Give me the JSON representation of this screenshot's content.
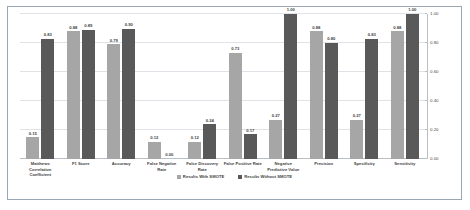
{
  "chart_data": {
    "type": "bar",
    "title": "",
    "xlabel": "",
    "ylabel": "",
    "ylim": [
      0.0,
      1.0
    ],
    "yticks": [
      "0.00",
      "0.20",
      "0.40",
      "0.60",
      "0.80",
      "1.00"
    ],
    "ytick_values": [
      0.0,
      0.2,
      0.4,
      0.6,
      0.8,
      1.0
    ],
    "y_axis_position": "right",
    "grid": true,
    "legend_position": "bottom-center",
    "categories": [
      "Matthews Correlation Coefficient",
      "F1 Score",
      "Accuracy",
      "False Negative Rate",
      "False Discovery Rate",
      "False Positive Rate",
      "Negative Predictive Value",
      "Precision",
      "Specificity",
      "Sensitivity"
    ],
    "series": [
      {
        "name": "Results With SMOTE",
        "color": "#a6a6a6",
        "values": [
          0.15,
          0.88,
          0.79,
          0.12,
          0.12,
          0.73,
          0.27,
          0.88,
          0.27,
          0.88
        ],
        "labels": [
          "0.15",
          "0.88",
          "0.79",
          "0.12",
          "0.12",
          "0.73",
          "0.27",
          "0.88",
          "0.27",
          "0.88"
        ]
      },
      {
        "name": "Results Without SMOTE",
        "color": "#595959",
        "values": [
          0.83,
          0.89,
          0.9,
          0.0,
          0.24,
          0.17,
          1.0,
          0.8,
          0.83,
          1.0
        ],
        "labels": [
          "0.83",
          "0.89",
          "0.90",
          "0.00",
          "0.24",
          "0.17",
          "1.00",
          "0.80",
          "0.83",
          "1.00"
        ]
      }
    ]
  },
  "colors": {
    "series_with_smote": "#a6a6a6",
    "series_without_smote": "#595959",
    "frame_border": "#9aa7b4",
    "gridline": "#dfe2e6",
    "axis_line": "#b9bfc6",
    "background": "#ffffff"
  }
}
